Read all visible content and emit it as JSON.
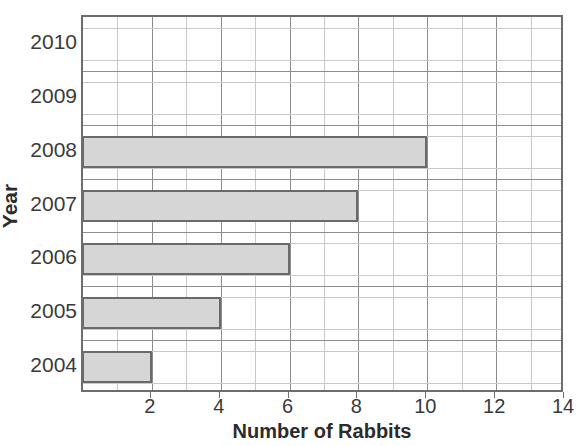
{
  "chart_data": {
    "type": "bar",
    "orientation": "horizontal",
    "title": "",
    "xlabel": "Number of Rabbits",
    "ylabel": "Year",
    "categories": [
      "2004",
      "2005",
      "2006",
      "2007",
      "2008",
      "2009",
      "2010"
    ],
    "values": [
      2,
      4,
      6,
      8,
      10,
      0,
      0
    ],
    "xlim": [
      0,
      14
    ],
    "x_ticks": [
      2,
      4,
      6,
      8,
      10,
      12,
      14
    ],
    "x_tick_labels": [
      "2",
      "4",
      "6",
      "8",
      "10",
      "12",
      "14"
    ],
    "x_minor_step": 1,
    "grid": true,
    "legend": null,
    "bar_fill_color": "#d6d6d6",
    "bar_border_color": "#6a6a6a",
    "gridline_color": "#c9c9c9",
    "major_gridline_color": "#8d8d8d",
    "axis_color": "#6d6d6d",
    "text_color": "#3a3a3a",
    "background_color": "#ffffff"
  },
  "axes": {
    "y_title": "Year",
    "x_title": "Number of Rabbits"
  }
}
